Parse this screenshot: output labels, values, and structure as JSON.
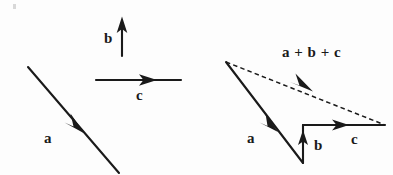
{
  "figure": {
    "background_color": "#fdfdfd",
    "stroke_color": "#1a1a1a",
    "panels": [
      {
        "name": "given-vectors",
        "description": "Three separate given vectors a, b and c",
        "vectors": [
          {
            "label": "a",
            "label_x": 44,
            "label_y": 131,
            "style": "solid",
            "x1": 28,
            "y1": 67,
            "x2": 119,
            "y2": 173,
            "arrow_at": 0.55,
            "direction": "down-right"
          },
          {
            "label": "b",
            "label_x": 104,
            "label_y": 31,
            "style": "solid",
            "x1": 122,
            "y1": 56,
            "x2": 122,
            "y2": 17,
            "arrow_at": 1.0,
            "direction": "up"
          },
          {
            "label": "c",
            "label_x": 136,
            "label_y": 88,
            "style": "solid",
            "x1": 96,
            "y1": 80,
            "x2": 181,
            "y2": 80,
            "arrow_at": 0.63,
            "direction": "right"
          }
        ]
      },
      {
        "name": "resultant-construction",
        "description": "Head-to-tail construction with dashed resultant a + b + c",
        "vectors": [
          {
            "label": "a",
            "label_x": 247,
            "label_y": 131,
            "style": "solid",
            "x1": 226,
            "y1": 62,
            "x2": 303,
            "y2": 163,
            "arrow_at": 0.6,
            "direction": "down-right"
          },
          {
            "label": "b",
            "label_x": 314,
            "label_y": 138,
            "style": "solid",
            "x1": 303,
            "y1": 163,
            "x2": 303,
            "y2": 125,
            "arrow_at": 0.72,
            "direction": "up"
          },
          {
            "label": "c",
            "label_x": 351,
            "label_y": 132,
            "style": "solid",
            "x1": 303,
            "y1": 125,
            "x2": 385,
            "y2": 125,
            "arrow_at": 0.55,
            "direction": "right"
          },
          {
            "label": "a + b + c",
            "label_x": 282,
            "label_y": 45,
            "style": "dashed",
            "x1": 226,
            "y1": 62,
            "x2": 385,
            "y2": 125,
            "arrow_at": 0.47,
            "direction": "down-right"
          }
        ]
      }
    ]
  }
}
